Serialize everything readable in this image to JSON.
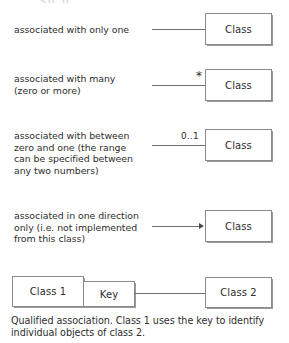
{
  "figure": {
    "top_cut_text": "so g",
    "caption": "Qualified association. Class 1 uses the key to identify\nindividual objects of class 2."
  },
  "colors": {
    "background": "#ffffff",
    "text": "#2e2e2e",
    "box_border": "#8a8a8a",
    "line": "#6f6f6f",
    "arrow": "#4a4a4a"
  },
  "rows": [
    {
      "description": "associated with only one",
      "multiplicity": "",
      "class_label": "Class",
      "connector": "plain-line"
    },
    {
      "description": "associated with many\n(zero or more)",
      "multiplicity": "*",
      "class_label": "Class",
      "connector": "plain-line"
    },
    {
      "description": "associated with between\nzero and one (the range\ncan be specified between\nany two numbers)",
      "multiplicity": "0..1",
      "class_label": "Class",
      "connector": "plain-line"
    },
    {
      "description": "associated in one direction\nonly (i.e. not implemented\nfrom this class)",
      "multiplicity": "",
      "class_label": "Class",
      "connector": "arrow"
    }
  ],
  "qualified_association": {
    "source_class_label": "Class 1",
    "qualifier_label": "Key",
    "target_class_label": "Class 2"
  }
}
